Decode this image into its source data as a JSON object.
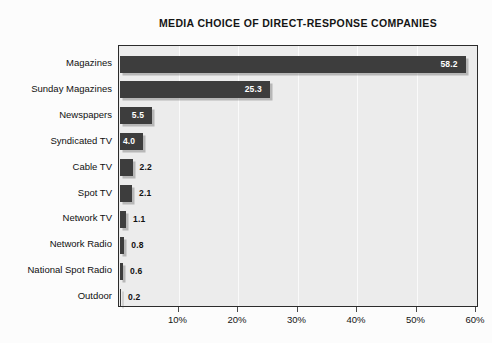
{
  "chart_data": {
    "type": "bar",
    "orientation": "horizontal",
    "title": "MEDIA CHOICE OF DIRECT-RESPONSE COMPANIES",
    "xlabel": "",
    "ylabel": "",
    "categories": [
      "Magazines",
      "Sunday Magazines",
      "Newspapers",
      "Syndicated TV",
      "Cable TV",
      "Spot TV",
      "Network TV",
      "Network Radio",
      "National Spot Radio",
      "Outdoor"
    ],
    "values": [
      58.2,
      25.3,
      5.5,
      4.0,
      2.2,
      2.1,
      1.1,
      0.8,
      0.6,
      0.2
    ],
    "value_labels": [
      "58.2",
      "25.3",
      "5.5",
      "4.0",
      "2.2",
      "2.1",
      "1.1",
      "0.8",
      "0.6",
      "0.2"
    ],
    "label_placement": [
      "inside",
      "inside",
      "inside",
      "inside",
      "outside",
      "outside",
      "outside",
      "outside",
      "outside",
      "outside"
    ],
    "xlim": [
      0,
      60
    ],
    "xtick_values": [
      10,
      20,
      30,
      40,
      50,
      60
    ],
    "xtick_labels": [
      "10%",
      "20%",
      "30%",
      "40%",
      "50%",
      "60%"
    ],
    "grid": true,
    "grid_axis": "x",
    "legend": false,
    "bar_color": "#3d3d3d",
    "plot_background": "#ececec",
    "gridline_color": "#fafafa",
    "axis_color": "#2b2b2b",
    "label_inside_color": "#ffffff",
    "label_outside_color": "#111111"
  }
}
